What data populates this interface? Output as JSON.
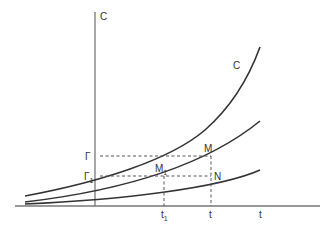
{
  "diagram": {
    "axes": {
      "y_label": "C",
      "x_label_end": "t"
    },
    "curves": [
      {
        "name": "upper-curve",
        "label": "C"
      },
      {
        "name": "middle-curve",
        "label": ""
      },
      {
        "name": "lower-curve",
        "label": ""
      }
    ],
    "points": {
      "M": "M",
      "M1": "M",
      "M1_sub": "1",
      "N": "N"
    },
    "y_ticks": {
      "gamma": "Γ",
      "gamma1": "Γ",
      "gamma1_sub": "1"
    },
    "x_ticks": {
      "t1": "t",
      "t1_sub": "1",
      "t": "t",
      "t_end": "t"
    },
    "colors": {
      "axis": "#777777",
      "curve": "#333333",
      "dash": "#555555"
    }
  }
}
